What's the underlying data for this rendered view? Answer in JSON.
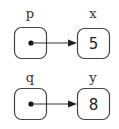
{
  "diagram": {
    "type": "pointer-diagram",
    "colors": {
      "stroke": "#444444",
      "text": "#222222",
      "background": "#ffffff"
    },
    "pointers": [
      {
        "name": "p",
        "target": "x",
        "target_value": "5"
      },
      {
        "name": "q",
        "target": "y",
        "target_value": "8"
      }
    ]
  }
}
